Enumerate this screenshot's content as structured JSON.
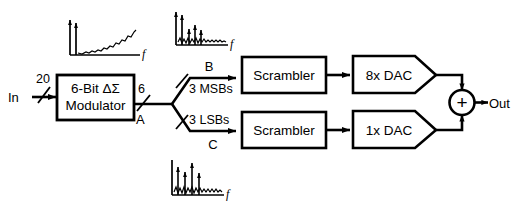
{
  "diagram": {
    "input_label": "In",
    "input_bus_width": "20",
    "output_label": "Out",
    "modulator": {
      "line1": "6-Bit ΔΣ",
      "line2": "Modulator",
      "output_bus_width": "6",
      "output_node": "A"
    },
    "split": {
      "msb_label": "3 MSBs",
      "lsb_label": "3 LSBs",
      "msb_node": "B",
      "lsb_node": "C"
    },
    "scrambler_top": "Scrambler",
    "scrambler_bottom": "Scrambler",
    "dac_top": "8x DAC",
    "dac_bottom": "1x DAC",
    "summer_symbol": "+",
    "plots": [
      {
        "name": "modulator-output-spectrum",
        "axis_label": "f",
        "description": "shaped noise floor rising with frequency plus one signal tone"
      },
      {
        "name": "msb-path-spectrum",
        "axis_label": "f",
        "description": "signal tone plus harmonic tones above noise floor"
      },
      {
        "name": "lsb-path-spectrum",
        "axis_label": "f",
        "description": "signal tone plus harmonic tones above noise floor"
      }
    ],
    "colors": {
      "ink": "#000000",
      "paper": "#ffffff"
    }
  }
}
